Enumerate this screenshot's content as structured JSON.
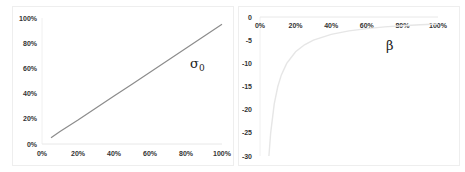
{
  "chart_data": [
    {
      "type": "line",
      "title": "",
      "annotation": "σ0",
      "xlabel": "",
      "ylabel": "",
      "x_ticks": [
        "0%",
        "20%",
        "40%",
        "60%",
        "80%",
        "100%"
      ],
      "y_ticks": [
        "0%",
        "20%",
        "40%",
        "60%",
        "80%",
        "100%"
      ],
      "xlim": [
        0,
        1
      ],
      "ylim": [
        0,
        1
      ],
      "grid": false,
      "legend": "none",
      "series": [
        {
          "name": "σ0",
          "color": "#8c8c8c",
          "x": [
            0.05,
            0.1,
            0.2,
            0.3,
            0.4,
            0.5,
            0.6,
            0.7,
            0.8,
            0.9,
            1.0
          ],
          "y": [
            0.05,
            0.1,
            0.19,
            0.285,
            0.38,
            0.475,
            0.57,
            0.665,
            0.76,
            0.855,
            0.95
          ]
        }
      ]
    },
    {
      "type": "line",
      "title": "",
      "annotation": "β",
      "xlabel": "",
      "ylabel": "",
      "x_ticks": [
        "0%",
        "20%",
        "40%",
        "60%",
        "80%",
        "100%"
      ],
      "y_ticks": [
        "0",
        "-5",
        "-10",
        "-15",
        "-20",
        "-25",
        "-30"
      ],
      "xlim": [
        0,
        1
      ],
      "ylim": [
        -30,
        0
      ],
      "grid": false,
      "legend": "none",
      "x_axis_position": "top",
      "series": [
        {
          "name": "β",
          "color": "#e6e6e6",
          "x": [
            0.05,
            0.06,
            0.08,
            0.1,
            0.12,
            0.15,
            0.2,
            0.25,
            0.3,
            0.4,
            0.5,
            0.6,
            0.7,
            0.8,
            0.9,
            1.0
          ],
          "y": [
            -30,
            -25,
            -18.75,
            -15,
            -12.5,
            -10,
            -7.5,
            -6,
            -5,
            -3.75,
            -3,
            -2.5,
            -2.14,
            -1.88,
            -1.67,
            -1.5
          ]
        }
      ]
    }
  ]
}
